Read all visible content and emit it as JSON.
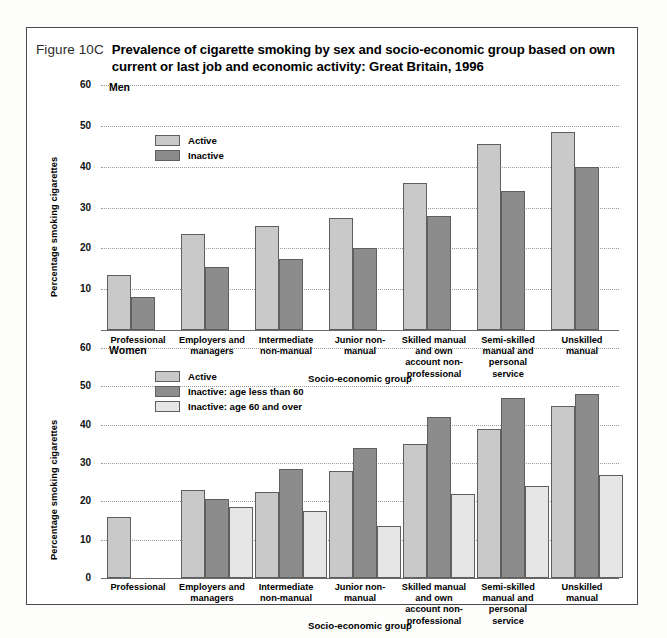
{
  "figure": {
    "number": "Figure 10C",
    "title": "Prevalence of cigarette smoking by sex and socio-economic group based on own current or last job and economic activity: Great Britain, 1996"
  },
  "colors": {
    "active": "#c9c9c9",
    "inactive": "#8c8c8c",
    "inactive_60_over": "#e6e6e6",
    "gridline": "#9a9a9a",
    "border": "#4a4a4a"
  },
  "men": {
    "panel_label": "Men",
    "ylabel": "Percentage smoking cigarettes",
    "xlabel": "Socio-economic group",
    "yticks": [
      "60",
      "50",
      "40",
      "30",
      "20",
      "10"
    ],
    "legend": [
      {
        "key": "active",
        "label": "Active"
      },
      {
        "key": "inactive",
        "label": "Inactive"
      }
    ]
  },
  "women": {
    "panel_label": "Women",
    "ylabel": "Percentage smoking cigarettes",
    "xlabel": "Socio-economic group",
    "yticks": [
      "60",
      "50",
      "40",
      "30",
      "20",
      "10",
      "0"
    ],
    "legend": [
      {
        "key": "active",
        "label": "Active"
      },
      {
        "key": "inactive",
        "label": "Inactive: age less than 60"
      },
      {
        "key": "inactive60",
        "label": "Inactive: age 60 and over"
      }
    ]
  },
  "chart_data": [
    {
      "type": "bar",
      "title": "Men",
      "xlabel": "Socio-economic group",
      "ylabel": "Percentage smoking cigarettes",
      "ylim": [
        0,
        60
      ],
      "yticks": [
        10,
        20,
        30,
        40,
        50,
        60
      ],
      "grid": true,
      "legend_position": "top-left-inside",
      "categories": [
        "Professional",
        "Employers and managers",
        "Intermediate non-manual",
        "Junior non-manual",
        "Skilled manual and own account non-professional",
        "Semi-skilled manual and personal service",
        "Unskilled manual"
      ],
      "series": [
        {
          "name": "Active",
          "values": [
            13.5,
            23.5,
            25.5,
            27.5,
            36.0,
            45.5,
            48.5
          ]
        },
        {
          "name": "Inactive",
          "values": [
            8.0,
            15.5,
            17.5,
            20.0,
            28.0,
            34.0,
            40.0
          ]
        }
      ]
    },
    {
      "type": "bar",
      "title": "Women",
      "xlabel": "Socio-economic group",
      "ylabel": "Percentage smoking cigarettes",
      "ylim": [
        0,
        60
      ],
      "yticks": [
        0,
        10,
        20,
        30,
        40,
        50,
        60
      ],
      "grid": true,
      "legend_position": "top-left-inside",
      "categories": [
        "Professional",
        "Employers and managers",
        "Intermediate non-manual",
        "Junior non-manual",
        "Skilled manual and own account non-professional",
        "Semi-skilled manual and personal service",
        "Unskilled manual"
      ],
      "series": [
        {
          "name": "Active",
          "values": [
            16.0,
            23.0,
            22.5,
            28.0,
            35.0,
            39.0,
            45.0
          ]
        },
        {
          "name": "Inactive: age less than 60",
          "values": [
            null,
            20.5,
            28.5,
            34.0,
            42.0,
            47.0,
            48.0
          ]
        },
        {
          "name": "Inactive: age 60 and over",
          "values": [
            null,
            18.5,
            17.5,
            13.5,
            22.0,
            24.0,
            27.0
          ]
        }
      ]
    }
  ]
}
